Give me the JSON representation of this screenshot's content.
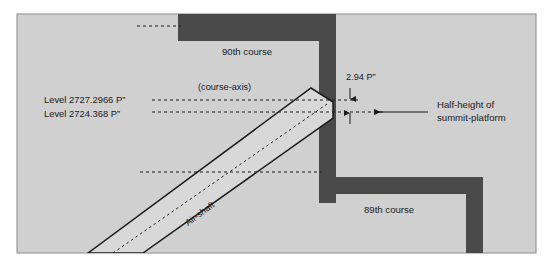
{
  "figure": {
    "kind": "architectural-section-diagram",
    "background_color": "#ffffff",
    "panel_fill": "#d0d0d0",
    "panel_border_color": "#9a9a9a",
    "masonry_color": "#4a4a4a",
    "shaft_fill": "#d8d8d8",
    "line_color": "#1b1b1b",
    "text_color": "#1b1b1b"
  },
  "labels": {
    "course_upper": "90th course",
    "course_lower": "89th course",
    "course_axis": "(course-axis)",
    "level_upper": "Level 2727.2966 P”",
    "level_lower": "Level 2724.368 P”",
    "dimension": "2.94 P”",
    "callout_line1": "Half-height of",
    "callout_line2": "summit-platform",
    "shaft": "Air-shaft"
  }
}
